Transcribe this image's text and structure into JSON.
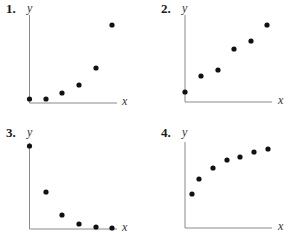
{
  "chart_data": [
    {
      "type": "scatter",
      "label": "1.",
      "xlabel": "x",
      "ylabel": "y",
      "grid": false,
      "description": "Increasing, concave up (exponential-like)",
      "points": [
        [
          0,
          0.05
        ],
        [
          1,
          0.05
        ],
        [
          2,
          0.15
        ],
        [
          3,
          0.3
        ],
        [
          4,
          0.5
        ],
        [
          5,
          1.0
        ]
      ],
      "px": {
        "origin": [
          29.5,
          103
        ],
        "pts": [
          [
            29.5,
            99
          ],
          [
            46,
            99
          ],
          [
            62,
            93
          ],
          [
            79,
            85
          ],
          [
            96,
            68
          ],
          [
            112,
            25
          ]
        ],
        "axis_top": 15,
        "axis_right": 117
      }
    },
    {
      "type": "scatter",
      "label": "2.",
      "xlabel": "x",
      "ylabel": "y",
      "grid": false,
      "description": "Increasing, roughly linear",
      "points": [
        [
          0,
          0.12
        ],
        [
          1,
          0.33
        ],
        [
          2,
          0.42
        ],
        [
          3,
          0.65
        ],
        [
          4,
          0.75
        ],
        [
          5,
          0.95
        ]
      ],
      "px": {
        "origin": [
          185,
          102
        ],
        "pts": [
          [
            185,
            92
          ],
          [
            201,
            76
          ],
          [
            218,
            70
          ],
          [
            234,
            49
          ],
          [
            251,
            41
          ],
          [
            267,
            25
          ]
        ],
        "axis_top": 15,
        "axis_right": 272
      }
    },
    {
      "type": "scatter",
      "label": "3.",
      "xlabel": "x",
      "ylabel": "y",
      "grid": false,
      "description": "Decreasing, concave up (exponential decay)",
      "points": [
        [
          0,
          1.0
        ],
        [
          1,
          0.45
        ],
        [
          2,
          0.17
        ],
        [
          3,
          0.06
        ],
        [
          4,
          0.02
        ],
        [
          5,
          0.01
        ]
      ],
      "px": {
        "origin": [
          29.5,
          229
        ],
        "pts": [
          [
            29.5,
            146
          ],
          [
            46,
            192
          ],
          [
            62,
            215
          ],
          [
            79,
            224
          ],
          [
            96,
            227
          ],
          [
            112,
            228
          ]
        ],
        "axis_top": 143,
        "axis_right": 117
      }
    },
    {
      "type": "scatter",
      "label": "4.",
      "xlabel": "x",
      "ylabel": "y",
      "grid": false,
      "description": "Increasing, concave down (logarithmic-like)",
      "points": [
        [
          0.5,
          0.45
        ],
        [
          1,
          0.6
        ],
        [
          2,
          0.7
        ],
        [
          3,
          0.78
        ],
        [
          4,
          0.8
        ],
        [
          5,
          0.85
        ],
        [
          6,
          0.88
        ]
      ],
      "px": {
        "origin": [
          185,
          228
        ],
        "pts": [
          [
            192,
            194
          ],
          [
            199,
            179
          ],
          [
            213,
            168
          ],
          [
            227,
            160
          ],
          [
            240,
            157
          ],
          [
            254,
            152
          ],
          [
            268,
            149
          ]
        ],
        "axis_top": 142,
        "axis_right": 272
      }
    }
  ],
  "panels": [
    {
      "number": "1.",
      "x_label": "x",
      "y_label": "y"
    },
    {
      "number": "2.",
      "x_label": "x",
      "y_label": "y"
    },
    {
      "number": "3.",
      "x_label": "x",
      "y_label": "y"
    },
    {
      "number": "4.",
      "x_label": "x",
      "y_label": "y"
    }
  ],
  "colors": {
    "axis": "#8a8a8a",
    "point": "#111111",
    "text": "#1a1a1a"
  }
}
